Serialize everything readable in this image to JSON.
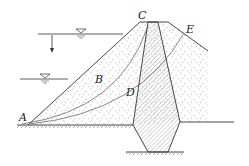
{
  "diagram": {
    "type": "earth-rock dam cross-section with clay core and slip surfaces",
    "labels": {
      "A": "A",
      "B": "B",
      "C": "C",
      "D": "D",
      "E": "E"
    },
    "water_levels": [
      {
        "name": "upper-water-level",
        "symbol": "▽"
      },
      {
        "name": "lower-water-level",
        "symbol": "▽"
      }
    ],
    "drawdown_arrow": "↓",
    "colors": {
      "line": "#333333",
      "fill_sand": "#ffffff",
      "dots": "#555555",
      "core_hatch": "#777777"
    }
  }
}
